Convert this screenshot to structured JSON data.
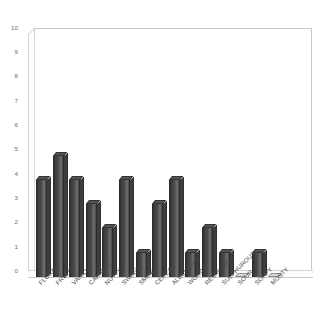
{
  "chart_data": {
    "type": "bar",
    "title": "",
    "subtitle": "",
    "xlabel": "",
    "ylabel": "",
    "ylim": [
      0,
      10
    ],
    "y_ticks": [
      0,
      1,
      2,
      3,
      4,
      5,
      6,
      7,
      8,
      9,
      10
    ],
    "grid": false,
    "legend": null,
    "legend_position": "none",
    "orientation": "vertical",
    "style": "3d-column",
    "categories": [
      "FLORAL",
      "FRUITY",
      "VANILLA",
      "CARAMEL",
      "NUTTY",
      "SWEET",
      "SMOKY",
      "CEREAL",
      "ALDEHYDIC",
      "WOODY",
      "RESINOUS",
      "SULPHUROUS",
      "SOUR",
      "SOAPY",
      "MUSTY"
    ],
    "values": [
      4,
      5,
      4,
      3,
      2,
      4,
      1,
      3,
      4,
      1,
      2,
      1,
      0,
      1,
      0
    ],
    "colors": {
      "bar_face": "#4a4a4a",
      "bar_highlight": "#6f6f6f",
      "bar_edge": "#2b2b2b",
      "bar_cap": "#535353",
      "zero_cap": "#d9d9d9",
      "frame": "#c9c9c9",
      "tick_text": "#6d6d6d",
      "label_text": "#4a4a4a",
      "background": "#ffffff"
    }
  },
  "axes": {
    "y_tick_labels": [
      "10",
      "9",
      "8",
      "7",
      "6",
      "5",
      "4",
      "3",
      "2",
      "1",
      "0"
    ]
  }
}
